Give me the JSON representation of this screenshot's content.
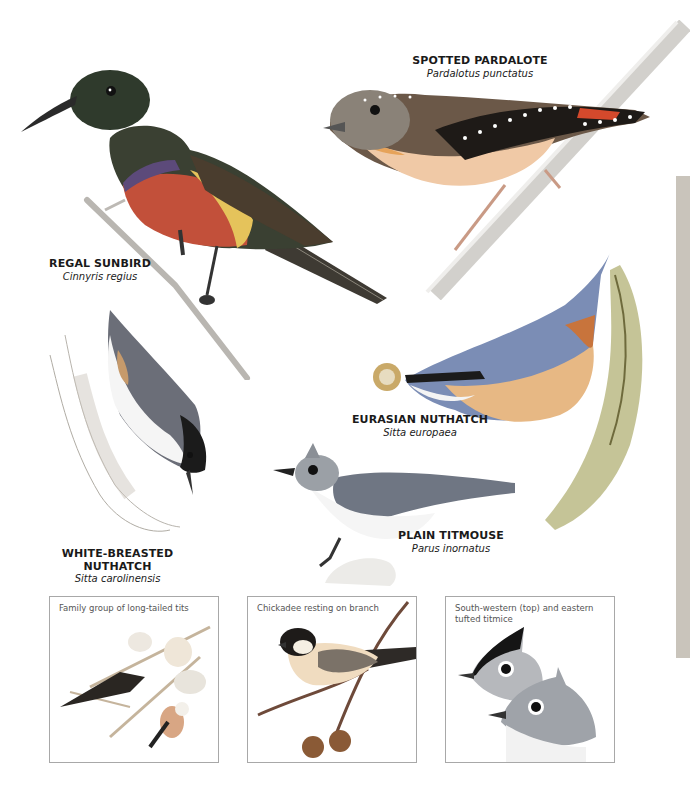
{
  "page": {
    "side_tab_color": "#c9c4bb"
  },
  "species": [
    {
      "id": "spotted-pardalote",
      "common": "SPOTTED PARDALOTE",
      "scientific": "Pardalotus punctatus"
    },
    {
      "id": "regal-sunbird",
      "common": "REGAL SUNBIRD",
      "scientific": "Cinnyris regius"
    },
    {
      "id": "eurasian-nuthatch",
      "common": "EURASIAN NUTHATCH",
      "scientific": "Sitta europaea"
    },
    {
      "id": "plain-titmouse",
      "common": "PLAIN TITMOUSE",
      "scientific": "Parus inornatus"
    },
    {
      "id": "white-breasted-nuthatch",
      "common_line1": "WHITE-BREASTED",
      "common_line2": "NUTHATCH",
      "scientific": "Sitta carolinensis"
    }
  ],
  "insets": [
    {
      "caption": "Family group of long-tailed tits"
    },
    {
      "caption": "Chickadee resting on branch"
    },
    {
      "caption": "South-western (top) and eastern tufted titmice"
    }
  ]
}
